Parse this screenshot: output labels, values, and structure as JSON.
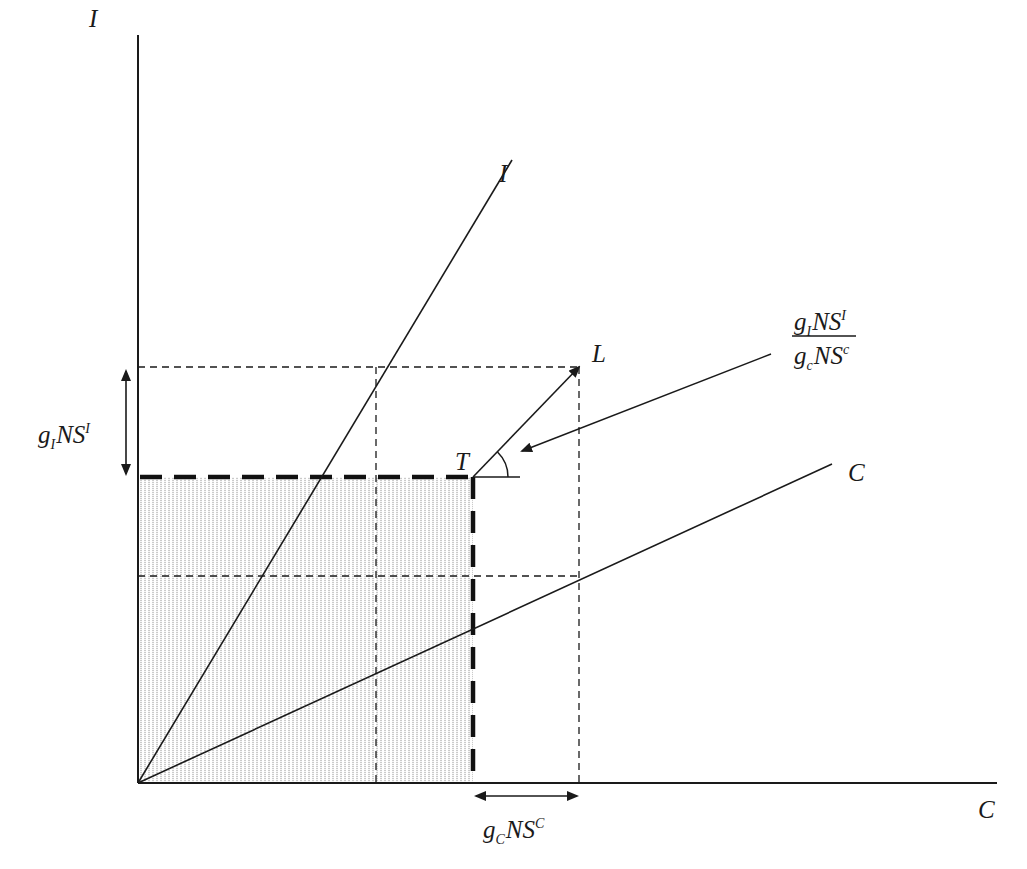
{
  "diagram": {
    "type": "economics-growth-diagram",
    "axes": {
      "y_label": "I",
      "x_label": "C"
    },
    "lines": {
      "investment_ray_label": "I",
      "consumption_ray_label": "C",
      "point_T_label": "T",
      "point_L_label": "L"
    },
    "annotations": {
      "vertical_span": {
        "g": "g",
        "sub": "I",
        "base": "NS",
        "sup": "I"
      },
      "horizontal_span": {
        "g": "g",
        "sub": "C",
        "base": "NS",
        "sup": "C"
      },
      "slope_fraction": {
        "numerator": {
          "g": "g",
          "sub": "I",
          "base": "NS",
          "sup": "I"
        },
        "denominator": {
          "g": "g",
          "sub": "c",
          "base": "NS",
          "sup": "c"
        }
      }
    },
    "colors": {
      "ink": "#1a1a1a",
      "hatch": "#7a7a7a",
      "background": "#ffffff"
    }
  }
}
